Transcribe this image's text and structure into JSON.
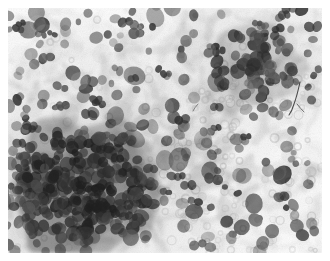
{
  "image": {
    "kind": "microscopy-photomicrograph",
    "modality": "brightfield light microscopy",
    "stain_appearance": "grayscale / monochrome",
    "subject": "cytology smear with clustered cell nuclei",
    "alt_text": "Grayscale photomicrograph of a cytology smear showing a dense dark cluster of cell nuclei at the lower left, scattered dark round nuclei across the field, pale gray cytoplasmic and stromal smears, and numerous small pale ring-shaped red blood cells, all on a white background.",
    "width_px": 330,
    "height_px": 261
  },
  "frame": {
    "margin_px": 8,
    "field_width_px": 314,
    "field_height_px": 245,
    "background_color": "#ffffff",
    "field_base_color": "#fdfdfd"
  },
  "palette": {
    "background": "#ffffff",
    "field_base": "#fdfdfd",
    "nucleus_dark": "#3b3b3b",
    "nucleus_mid": "#5d5d5d",
    "nucleus_light": "#7e7e7e",
    "cytoplasm_gray": "#c9c9c9",
    "stroma_gray": "#dcdcdc",
    "erythrocyte_ring": "#d2d2d2",
    "cluster_core": "#6a6a6a",
    "fiber_artifact": "#2e2e2e"
  },
  "regions": [
    {
      "id": "upper-left-scatter",
      "label": "Scattered dark nuclei over pale stroma",
      "x": 0,
      "y": 0,
      "w": 165,
      "h": 130
    },
    {
      "id": "upper-right-cluster",
      "label": "Dark nuclear cluster, upper right",
      "x": 165,
      "y": 0,
      "w": 165,
      "h": 130
    },
    {
      "id": "lower-left-dense",
      "label": "Dense confluent cell cluster",
      "x": 0,
      "y": 130,
      "w": 165,
      "h": 131
    },
    {
      "id": "lower-right-sparse",
      "label": "Sparse nuclei with erythrocyte rings",
      "x": 165,
      "y": 130,
      "w": 165,
      "h": 131
    }
  ],
  "features": {
    "dense_cluster": {
      "present": true,
      "location": "lower-left",
      "tone": "#6a6a6a"
    },
    "secondary_cluster": {
      "present": true,
      "location": "upper-right",
      "tone": "#5d5d5d"
    },
    "erythrocyte_rings": {
      "present": true,
      "location": "right half",
      "tone": "#d2d2d2"
    },
    "fiber_artifact": {
      "present": true,
      "location": "upper-right",
      "tone": "#2e2e2e"
    },
    "approx_nucleus_count": 520,
    "approx_ring_count": 190
  }
}
